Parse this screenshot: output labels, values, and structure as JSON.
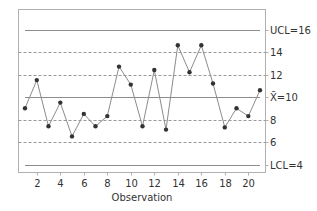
{
  "chart_data": {
    "type": "line",
    "subtype": "control-chart",
    "title": "",
    "xlabel": "Observation",
    "ylabel": "",
    "x": [
      1,
      2,
      3,
      4,
      5,
      6,
      7,
      8,
      9,
      10,
      11,
      12,
      13,
      14,
      15,
      16,
      17,
      18,
      19,
      20,
      21
    ],
    "series": [
      {
        "name": "Observations",
        "values": [
          9.0,
          11.5,
          7.4,
          9.5,
          6.5,
          8.5,
          7.4,
          8.3,
          12.7,
          11.1,
          7.4,
          12.4,
          7.1,
          14.6,
          12.2,
          14.6,
          11.2,
          7.3,
          9.0,
          8.3,
          10.6
        ]
      }
    ],
    "x_ticks": [
      2,
      4,
      6,
      8,
      10,
      12,
      14,
      16,
      18,
      20
    ],
    "x_tick_labels": [
      "2",
      "4",
      "6",
      "8",
      "10",
      "12",
      "14",
      "16",
      "18",
      "20"
    ],
    "ylim": [
      3,
      17
    ],
    "xlim": [
      0.4,
      21.6
    ],
    "reference_lines": [
      {
        "name": "UCL",
        "value": 16,
        "label": "UCL=16",
        "style": "solid"
      },
      {
        "name": "zone",
        "value": 14,
        "label": "14",
        "style": "dashed"
      },
      {
        "name": "zone",
        "value": 12,
        "label": "12",
        "style": "dashed"
      },
      {
        "name": "center",
        "value": 10,
        "label": "X̄=10",
        "style": "solid"
      },
      {
        "name": "zone",
        "value": 8,
        "label": "8",
        "style": "dashed"
      },
      {
        "name": "zone",
        "value": 6,
        "label": "6",
        "style": "dashed"
      },
      {
        "name": "LCL",
        "value": 4,
        "label": "LCL=4",
        "style": "solid"
      }
    ],
    "grid": false,
    "legend": "none",
    "colors": {
      "line": "#8c8c8c",
      "marker": "#333333",
      "ref_solid": "#8c8c8c",
      "ref_dashed": "#999999",
      "frame": "#b0b0b0"
    }
  }
}
